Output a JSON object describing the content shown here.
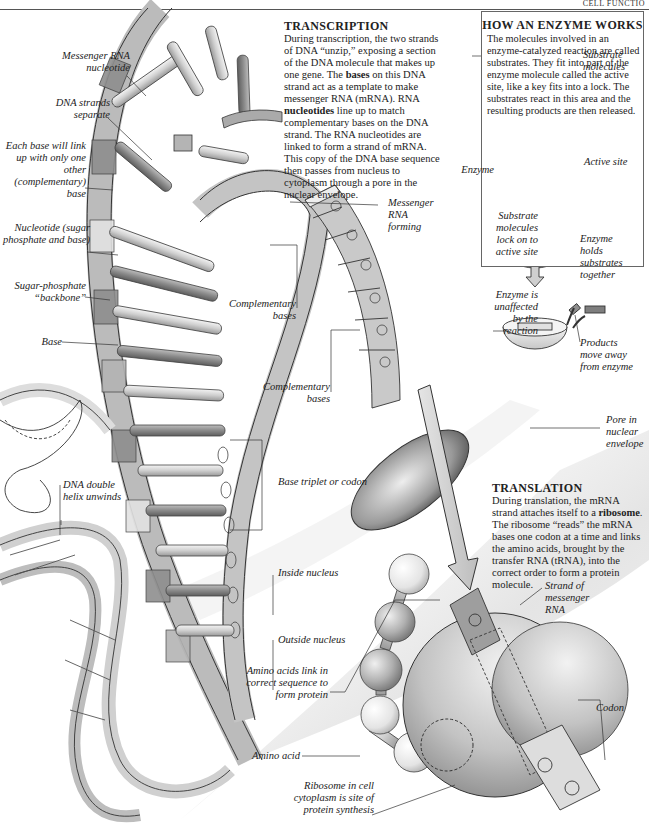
{
  "running_head": "CELL FUNCTIO",
  "transcription": {
    "title": "TRANSCRIPTION",
    "text_1": "During transcription, the two strands of DNA “unzip,” exposing a section of the DNA molecule that makes up one gene. The ",
    "bold_1": "bases",
    "text_2": " on this DNA strand act as a template to make messenger RNA (mRNA). RNA ",
    "bold_2": "nucleotides",
    "text_3": " line up to match complementary bases on the DNA strand. The RNA nucleotides are linked to form a strand of mRNA. This copy of the DNA base sequence then passes from nucleus to cytoplasm through a pore in the nuclear envelope."
  },
  "enzyme_box": {
    "title": "HOW AN ENZYME WORKS",
    "text": "The molecules involved in an enzyme-catalyzed reaction are called substrates. They fit into part of the enzyme molecule called the active site, like a key fits into a lock. The substrates react in this area and the resulting products are then released.",
    "labels": {
      "substrate_molecules": "Substrate molecules",
      "enzyme": "Enzyme",
      "active_site": "Active site",
      "substrates_lock": "Substrate molecules lock on to active site",
      "enzyme_holds": "Enzyme holds substrates together",
      "enzyme_unaffected": "Enzyme is unaffected by the reaction",
      "products_move": "Products move away from enzyme"
    }
  },
  "translation": {
    "title": "TRANSLATION",
    "text_1": "During translation, the mRNA strand attaches itself to a ",
    "bold_1": "ribosome",
    "text_2": ". The ribosome “reads” the mRNA bases one codon at a time and links the amino acids, brought by the transfer RNA (tRNA), into the correct order to form a protein molecule."
  },
  "labels": {
    "messenger_rna_nucleotide": "Messenger RNA nucleotide",
    "dna_strands_separate": "DNA strands separate",
    "each_base": "Each base will link up with only one other (complementary) base",
    "nucleotide": "Nucleotide (sugar phosphate and base)",
    "sugar_phosphate": "Sugar-phosphate “backbone”",
    "base": "Base",
    "dna_double_helix": "DNA double helix unwinds",
    "messenger_rna_forming": "Messenger RNA forming",
    "complementary_bases_1": "Complementary bases",
    "complementary_bases_2": "Complementary bases",
    "base_triplet": "Base triplet or codon",
    "pore": "Pore in nuclear envelope",
    "inside_nucleus": "Inside nucleus",
    "outside_nucleus": "Outside nucleus",
    "amino_acids_link": "Amino acids link in correct sequence to form protein",
    "amino_acid": "Amino acid",
    "ribosome_site": "Ribosome in cell cytoplasm is site of protein synthesis",
    "strand_mrna": "Strand of messenger RNA",
    "codon": "Codon"
  },
  "colors": {
    "dark_segment": "#8e8e8e",
    "mid_segment": "#b4b4b4",
    "light_segment": "#e2e2e2",
    "outline": "#333333"
  }
}
